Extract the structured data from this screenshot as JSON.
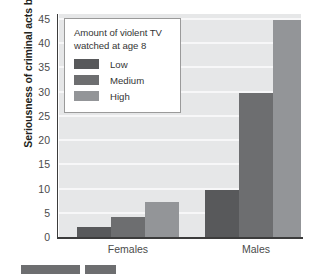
{
  "chart_data": {
    "type": "bar",
    "title": "",
    "xlabel": "",
    "ylabel": "Seriousness of criminal acts by age 30",
    "ylim": [
      0,
      46
    ],
    "ytick_labels": [
      "0",
      "5",
      "10",
      "15",
      "20",
      "25",
      "30",
      "35",
      "40",
      "45"
    ],
    "ytick_values": [
      0,
      5,
      10,
      15,
      20,
      25,
      30,
      35,
      40,
      45
    ],
    "categories": [
      "Females",
      "Males"
    ],
    "grid": "horizontal",
    "legend_position": "top-left-inside",
    "series": [
      {
        "name": "Low",
        "color": "#58595b",
        "values": [
          2,
          9.7
        ]
      },
      {
        "name": "Medium",
        "color": "#6d6e70",
        "values": [
          4.2,
          29.8
        ]
      },
      {
        "name": "High",
        "color": "#939598",
        "values": [
          7.2,
          44.7
        ]
      }
    ]
  },
  "axis": {
    "y_title": "Seriousness of criminal acts by age 30",
    "y_ticks": [
      "45",
      "40",
      "35",
      "30",
      "25",
      "20",
      "15",
      "10",
      "5",
      "0"
    ],
    "x_ticks": [
      "Females",
      "Males"
    ]
  },
  "legend": {
    "title": "Amount of violent TV watched at age 8",
    "title_line_1": "Amount of violent TV",
    "title_line_2": "watched at age 8",
    "items": [
      {
        "label": "Low",
        "color": "#58595b"
      },
      {
        "label": "Medium",
        "color": "#6d6e70"
      },
      {
        "label": "High",
        "color": "#939598"
      }
    ]
  },
  "colors": {
    "plot_background": "#e6e7e8",
    "gridline": "#f7f7f8",
    "axis": "#3c3c3c",
    "tick_text": "#4b4b4b",
    "legend_border": "#9a9a9a",
    "legend_background": "#ffffff",
    "series_low": "#58595b",
    "series_medium": "#6d6e70",
    "series_high": "#939598"
  },
  "bottom_strip": {
    "chips": [
      {
        "color": "#6d6e70",
        "left": 21,
        "width": 59
      },
      {
        "color": "#6d6e70",
        "left": 85,
        "width": 31
      }
    ]
  }
}
